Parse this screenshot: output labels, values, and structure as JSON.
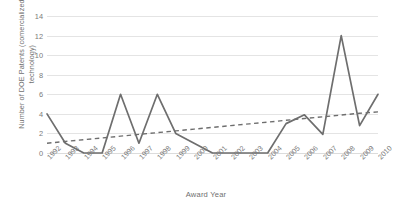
{
  "chart_data": {
    "type": "line",
    "title": "",
    "xlabel": "Award Year",
    "ylabel": "Number of DOE Patents (comercialized technology)",
    "categories": [
      "1992",
      "1993",
      "1994",
      "1995",
      "1996",
      "1997",
      "1998",
      "1999",
      "2000",
      "2001",
      "2002",
      "2003",
      "2004",
      "2005",
      "2006",
      "2007",
      "2008",
      "2009",
      "2010"
    ],
    "ylim": [
      0,
      14
    ],
    "yticks": [
      0,
      2,
      4,
      6,
      8,
      10,
      12,
      14
    ],
    "grid": true,
    "legend": "none",
    "series": [
      {
        "name": "Number of DOE Patents (comercialized technology)",
        "style": "solid",
        "color": "#6e6e6e",
        "values": [
          4,
          1,
          0,
          0,
          6,
          1,
          6,
          2,
          1,
          0,
          0,
          0,
          0,
          3,
          3.9,
          1.9,
          12,
          2.8,
          6
        ]
      },
      {
        "name": "Linear trendline",
        "style": "dashed",
        "color": "#6e6e6e",
        "values": [
          1.0,
          1.18,
          1.36,
          1.54,
          1.72,
          1.9,
          2.08,
          2.26,
          2.44,
          2.62,
          2.8,
          2.98,
          3.16,
          3.34,
          3.52,
          3.7,
          3.88,
          4.06,
          4.2
        ]
      }
    ]
  },
  "axes": {
    "y_title": "Number of DOE Patents (comercialized technology)",
    "x_title": "Award Year",
    "y_tick_labels": [
      "14",
      "12",
      "10",
      "8",
      "6",
      "4",
      "2",
      "0"
    ],
    "x_tick_labels": [
      "1992",
      "1993",
      "1994",
      "1995",
      "1996",
      "1997",
      "1998",
      "1999",
      "2000",
      "2001",
      "2002",
      "2003",
      "2004",
      "2005",
      "2006",
      "2007",
      "2008",
      "2009",
      "2010"
    ]
  },
  "colors": {
    "series_line": "#6e6e6e",
    "trendline": "#6e6e6e",
    "gridline": "#e4e4e4",
    "text": "#7b7b7b",
    "background": "#ffffff"
  }
}
